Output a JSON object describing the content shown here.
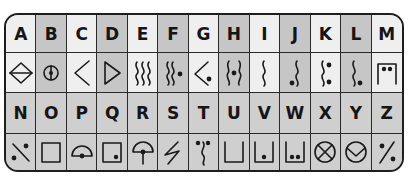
{
  "top_row": {
    "letters": [
      "A",
      "B",
      "C",
      "D",
      "E",
      "F",
      "G",
      "H",
      "I",
      "J",
      "K",
      "L",
      "M"
    ],
    "symbols": [
      "diamond-halved-icon",
      "circle-dot-line-icon",
      "left-chevron-icon",
      "right-triangle-icon",
      "three-waves-icon",
      "two-waves-dot-icon",
      "chevron-dot-icon",
      "waves-pair-center-dot-icon",
      "single-wave-icon",
      "wave-bottom-dot-icon",
      "wave-two-dots-icon",
      "wave-bottom-dot-alt-icon",
      "box-top-two-dots-icon"
    ]
  },
  "bottom_row": {
    "letters": [
      "N",
      "O",
      "P",
      "Q",
      "R",
      "S",
      "T",
      "U",
      "V",
      "W",
      "X",
      "Y",
      "Z"
    ],
    "symbols": [
      "slash-two-dots-icon",
      "square-icon",
      "half-circle-dot-icon",
      "square-corner-dot-icon",
      "umbrella-dot-icon",
      "zigzag-icon",
      "wave-top-two-dots-icon",
      "open-box-icon",
      "open-box-dot-icon",
      "open-box-two-dots-icon",
      "circle-x-icon",
      "circle-v-icon",
      "percent-icon"
    ]
  },
  "colors": {
    "light_cell": "#efefef",
    "dark_cell": "#c6c6c6",
    "bottom_cell": "#cfcfcf",
    "border": "#1e1e1e"
  }
}
